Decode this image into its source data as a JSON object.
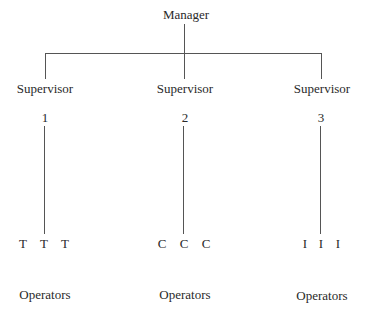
{
  "diagram": {
    "type": "organization-chart",
    "root": {
      "label": "Manager"
    },
    "supervisors": [
      {
        "label": "Supervisor",
        "number": "1",
        "operators": [
          "T",
          "T",
          "T"
        ],
        "operators_label": "Operators"
      },
      {
        "label": "Supervisor",
        "number": "2",
        "operators": [
          "C",
          "C",
          "C"
        ],
        "operators_label": "Operators"
      },
      {
        "label": "Supervisor",
        "number": "3",
        "operators": [
          "I",
          "I",
          "I"
        ],
        "operators_label": "Operators"
      }
    ]
  },
  "colors": {
    "line": "#555555",
    "text": "#2a2a2a",
    "background": "#ffffff"
  }
}
